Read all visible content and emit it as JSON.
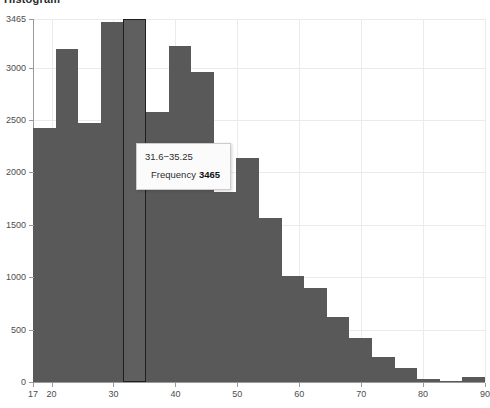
{
  "chart": {
    "title": "Histogram"
  },
  "tooltip": {
    "range": "31.6−35.25",
    "metric_label": "Frequency",
    "metric_value": "3465"
  },
  "colors": {
    "bar_fill": "#595959",
    "bar_highlight_border": "#1f1f1f",
    "gridline": "#ebebeb",
    "axis": "#9a9a9a",
    "tooltip_bg": "#fbfbfb",
    "tooltip_border": "#cccccc",
    "text": "#4d4d4d"
  },
  "chart_data": {
    "type": "bar",
    "title": "Histogram",
    "xlabel": "",
    "ylabel": "Frequency",
    "xlim": [
      17,
      90
    ],
    "ylim": [
      0,
      3465
    ],
    "grid": true,
    "legend": false,
    "bin_width": 3.65,
    "x_ticks": [
      17,
      20,
      30,
      40,
      50,
      60,
      70,
      80,
      90
    ],
    "x_tick_labels": [
      "17",
      "20",
      "30",
      "40",
      "50",
      "60",
      "70",
      "80",
      "90"
    ],
    "y_ticks": [
      0,
      500,
      1000,
      1500,
      2000,
      2500,
      3000,
      3465
    ],
    "y_tick_labels": [
      "0",
      "500",
      "1000",
      "1500",
      "2000",
      "2500",
      "3000",
      "3465"
    ],
    "highlighted_bin_index": 4,
    "bins": [
      {
        "label": "17−20.65",
        "start": 17.0,
        "end": 20.65,
        "value": 2420
      },
      {
        "label": "20.65−24.3",
        "start": 20.65,
        "end": 24.3,
        "value": 3180
      },
      {
        "label": "24.3−27.95",
        "start": 24.3,
        "end": 27.95,
        "value": 2470
      },
      {
        "label": "27.95−31.6",
        "start": 27.95,
        "end": 31.6,
        "value": 3440
      },
      {
        "label": "31.6−35.25",
        "start": 31.6,
        "end": 35.25,
        "value": 3465
      },
      {
        "label": "35.25−38.9",
        "start": 35.25,
        "end": 38.9,
        "value": 2580
      },
      {
        "label": "38.9−42.55",
        "start": 38.9,
        "end": 42.55,
        "value": 3210
      },
      {
        "label": "42.55−46.2",
        "start": 42.55,
        "end": 46.2,
        "value": 2960
      },
      {
        "label": "46.2−49.85",
        "start": 46.2,
        "end": 49.85,
        "value": 1810
      },
      {
        "label": "49.85−53.5",
        "start": 49.85,
        "end": 53.5,
        "value": 2140
      },
      {
        "label": "53.5−57.15",
        "start": 53.5,
        "end": 57.15,
        "value": 1570
      },
      {
        "label": "57.15−60.8",
        "start": 57.15,
        "end": 60.8,
        "value": 1010
      },
      {
        "label": "60.8−64.45",
        "start": 60.8,
        "end": 64.45,
        "value": 900
      },
      {
        "label": "64.45−68.1",
        "start": 64.45,
        "end": 68.1,
        "value": 620
      },
      {
        "label": "68.1−71.75",
        "start": 68.1,
        "end": 71.75,
        "value": 420
      },
      {
        "label": "71.75−75.4",
        "start": 71.75,
        "end": 75.4,
        "value": 240
      },
      {
        "label": "75.4−79.05",
        "start": 75.4,
        "end": 79.05,
        "value": 130
      },
      {
        "label": "79.05−82.7",
        "start": 79.05,
        "end": 82.7,
        "value": 30
      },
      {
        "label": "82.7−86.35",
        "start": 82.7,
        "end": 86.35,
        "value": 10
      },
      {
        "label": "86.35−90",
        "start": 86.35,
        "end": 90.0,
        "value": 45
      }
    ]
  }
}
